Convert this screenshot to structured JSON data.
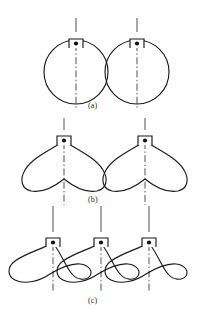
{
  "figure": {
    "top_caption": "",
    "background_color": "#ffffff",
    "ink_color": "#1a1a1a",
    "centerline_color": "#3a3a3a",
    "width": 202,
    "height": 319,
    "panels": [
      {
        "id": "a",
        "label": "(a)",
        "label_x": 88,
        "label_y": 101,
        "shape_kind": "circle",
        "description": "two tangent circular rotor profiles with top pivot brackets",
        "instances": [
          {
            "pivot_x": 76,
            "pivot_y": 39,
            "radius": 32
          },
          {
            "pivot_x": 137,
            "pivot_y": 39,
            "radius": 32
          }
        ],
        "centerline_top": 18,
        "centerline_bottom": 108
      },
      {
        "id": "b",
        "label": "(b)",
        "label_x": 88,
        "label_y": 195,
        "shape_kind": "heart-cam",
        "description": "two heart shaped cam lobes with bottom centre cusp",
        "instances": [
          {
            "pivot_x": 64,
            "pivot_y": 136
          },
          {
            "pivot_x": 145,
            "pivot_y": 136
          }
        ],
        "centerline_top": 118,
        "centerline_bottom": 205
      },
      {
        "id": "c",
        "label": "(c)",
        "label_x": 88,
        "label_y": 296,
        "shape_kind": "wing-cam",
        "description": "three overlapping asymmetric wing shaped cam profiles",
        "instances": [
          {
            "pivot_x": 53,
            "pivot_y": 238
          },
          {
            "pivot_x": 101,
            "pivot_y": 238
          },
          {
            "pivot_x": 149,
            "pivot_y": 238
          }
        ],
        "centerline_top": 206,
        "centerline_bottom": 292
      }
    ],
    "pivot_bracket": {
      "half_width": 7,
      "height": 9,
      "dot_radius": 2.1,
      "description": "small square bracket above profile apex enclosing a filled pivot dot"
    }
  }
}
